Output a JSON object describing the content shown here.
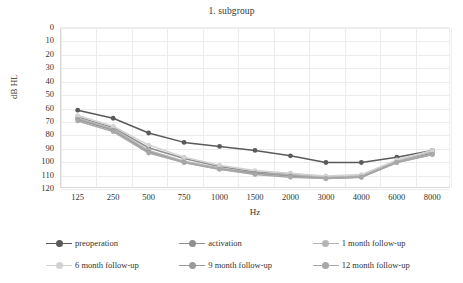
{
  "chart_data": {
    "type": "line",
    "title": "1. subgroup",
    "xlabel": "Hz",
    "ylabel": "dB HL",
    "categories": [
      "125",
      "250",
      "500",
      "750",
      "1000",
      "1500",
      "2000",
      "3000",
      "4000",
      "6000",
      "8000"
    ],
    "ylim": [
      0,
      120
    ],
    "y_inverted": true,
    "yticks": [
      "0",
      "10",
      "20",
      "30",
      "40",
      "50",
      "60",
      "70",
      "80",
      "90",
      "100",
      "110",
      "120"
    ],
    "grid": true,
    "legend_position": "bottom",
    "series": [
      {
        "name": "preoperation",
        "color": "#5a5a5a",
        "values": [
          62,
          68,
          79,
          86,
          89,
          92,
          96,
          101,
          101,
          97,
          92
        ]
      },
      {
        "name": "activation",
        "color": "#8f8f8f",
        "values": [
          67,
          75,
          90,
          98,
          104,
          108,
          110,
          112,
          111,
          100,
          94
        ]
      },
      {
        "name": "1 month follow-up",
        "color": "#b5b5b5",
        "values": [
          68,
          76,
          92,
          100,
          105,
          109,
          110,
          112,
          111,
          100,
          93
        ]
      },
      {
        "name": "6 month follow-up",
        "color": "#d2d2d2",
        "values": [
          66,
          74,
          88,
          97,
          103,
          107,
          109,
          111,
          110,
          99,
          92
        ]
      },
      {
        "name": "9 month follow-up",
        "color": "#9a9a9a",
        "values": [
          69,
          77,
          93,
          101,
          106,
          109,
          111,
          113,
          112,
          101,
          95
        ]
      },
      {
        "name": "12 month follow-up",
        "color": "#a8a8a8",
        "values": [
          70,
          78,
          94,
          101,
          106,
          110,
          112,
          113,
          112,
          101,
          95
        ]
      }
    ]
  },
  "legend": {
    "rows": [
      [
        "preoperation",
        "activation",
        "1 month follow-up"
      ],
      [
        "6 month follow-up",
        "9 month follow-up",
        "12 month follow-up"
      ]
    ]
  }
}
